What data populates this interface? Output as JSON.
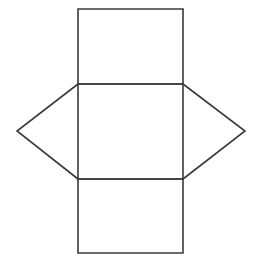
{
  "diagram": {
    "type": "triangular-prism-net",
    "canvas": {
      "width": 258,
      "height": 266,
      "background": "#ffffff"
    },
    "stroke_color": "#3a3a3a",
    "faces": [
      {
        "name": "top-rectangle",
        "shape": "rect",
        "points": "78,9 183,9 183,84 78,84"
      },
      {
        "name": "middle-rectangle",
        "shape": "rect",
        "points": "78,84 183,84 183,179 78,179"
      },
      {
        "name": "bottom-rectangle",
        "shape": "rect",
        "points": "78,179 183,179 183,253 78,253"
      },
      {
        "name": "left-triangle",
        "shape": "triangle",
        "points": "78,84 17,131 78,179"
      },
      {
        "name": "right-triangle",
        "shape": "triangle",
        "points": "183,84 245,131 183,179"
      }
    ]
  }
}
